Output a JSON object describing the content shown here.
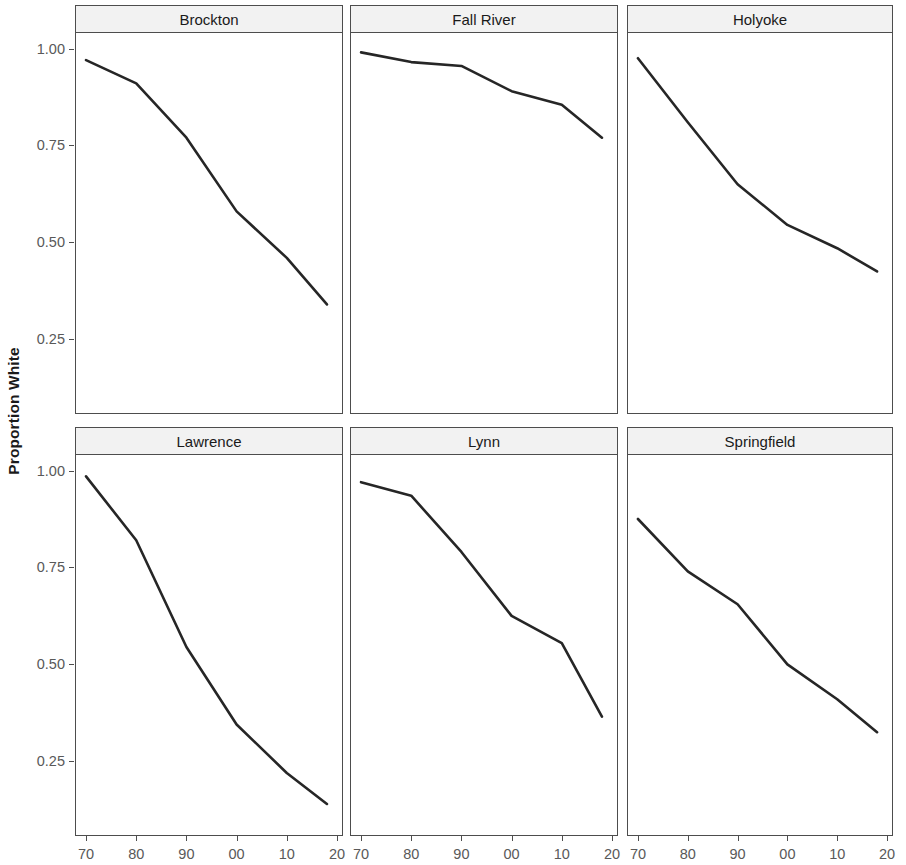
{
  "chart_data": {
    "type": "line",
    "title": "",
    "xlabel": "",
    "ylabel": "Proportion White",
    "facet_layout": {
      "rows": 2,
      "cols": 3
    },
    "x": [
      1970,
      1980,
      1990,
      2000,
      2010,
      2018
    ],
    "x_tick_labels": [
      "70",
      "80",
      "90",
      "00",
      "10",
      "20"
    ],
    "x_tick_values": [
      1970,
      1980,
      1990,
      2000,
      2010,
      2020
    ],
    "xlim": [
      1968,
      2021
    ],
    "y_tick_labels": [
      "1.00",
      "0.75",
      "0.50",
      "0.25"
    ],
    "y_tick_values": [
      1.0,
      0.75,
      0.5,
      0.25
    ],
    "ylim": [
      0.06,
      1.04
    ],
    "grid": false,
    "legend": "none",
    "line_color": "#262626",
    "strip_color": "#f2f2f2",
    "panels": [
      {
        "label": "Brockton",
        "values": [
          0.97,
          0.91,
          0.77,
          0.58,
          0.46,
          0.34
        ]
      },
      {
        "label": "Fall River",
        "values": [
          0.99,
          0.965,
          0.955,
          0.89,
          0.855,
          0.77
        ]
      },
      {
        "label": "Holyoke",
        "values": [
          0.975,
          0.81,
          0.65,
          0.545,
          0.485,
          0.425
        ]
      },
      {
        "label": "Lawrence",
        "values": [
          0.985,
          0.82,
          0.545,
          0.345,
          0.22,
          0.14
        ]
      },
      {
        "label": "Lynn",
        "values": [
          0.97,
          0.935,
          0.79,
          0.625,
          0.555,
          0.365
        ]
      },
      {
        "label": "Springfield",
        "values": [
          0.875,
          0.74,
          0.655,
          0.5,
          0.41,
          0.325
        ]
      }
    ]
  },
  "axis": {
    "y_title": "Proportion White"
  }
}
